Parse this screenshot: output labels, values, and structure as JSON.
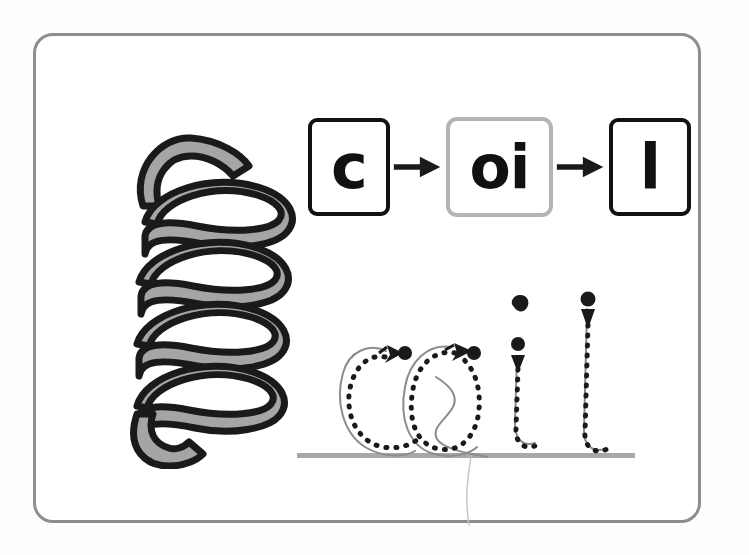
{
  "page": {
    "background_color": "#fdfdfd",
    "width": 749,
    "height": 555
  },
  "card": {
    "name": "handwriting-worksheet-card",
    "border_color": "#8e8e8e",
    "background_color": "#ffffff"
  },
  "illustration": {
    "name": "coil-spring-illustration",
    "subject": "coil",
    "fill_color": "#a5a5a5",
    "outline_color": "#1a1a1a",
    "turns": 4
  },
  "grapheme_sequence": {
    "name": "phoneme-grapheme-sequence",
    "boxes": [
      {
        "label": "c",
        "border_color": "#111111",
        "highlighted": false
      },
      {
        "label": "oi",
        "border_color": "#b4b4b4",
        "highlighted": true
      },
      {
        "label": "l",
        "border_color": "#111111",
        "highlighted": false
      }
    ],
    "arrows": [
      {
        "icon": "arrow-right-icon",
        "color": "#1a1a1a"
      },
      {
        "icon": "arrow-right-icon",
        "color": "#1a1a1a"
      }
    ]
  },
  "tracing_guide": {
    "name": "handwriting-tracing-guide",
    "word": "coil",
    "baseline_color": "#a8a8a8",
    "dotted_stroke_color": "#1a1a1a",
    "ghost_stroke_color": "#8c8c8c",
    "marker_color": "#1a1a1a",
    "letters": [
      {
        "letter": "c",
        "start_dot": true,
        "direction_arrow": "left",
        "strokes": 1
      },
      {
        "letter": "o",
        "start_dot": true,
        "direction_arrow": "left",
        "strokes": 1
      },
      {
        "letter": "i",
        "start_dot": true,
        "direction_arrow": "down",
        "strokes": 2,
        "has_tittle": true
      },
      {
        "letter": "l",
        "start_dot": true,
        "direction_arrow": "down",
        "strokes": 1
      }
    ]
  }
}
